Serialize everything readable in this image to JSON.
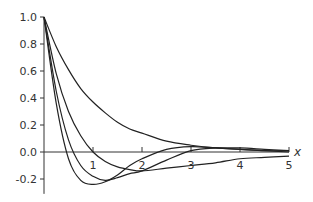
{
  "chart_data": {
    "type": "line",
    "title": "",
    "xlabel": "x",
    "ylabel": "",
    "xlim": [
      0,
      5
    ],
    "ylim": [
      -0.3,
      1.0
    ],
    "grid": false,
    "legend": null,
    "x_ticks": [
      "1",
      "2",
      "3",
      "4",
      "5"
    ],
    "y_ticks": [
      "1.0",
      "0.8",
      "0.6",
      "0.4",
      "0.2",
      "0.0",
      "-0.2"
    ],
    "x": [
      0,
      0.25,
      0.5,
      0.75,
      1,
      1.25,
      1.5,
      1.75,
      2,
      2.5,
      3,
      3.5,
      4,
      4.5,
      5
    ],
    "series": [
      {
        "name": "curve-1",
        "values": [
          1.0,
          0.78,
          0.61,
          0.47,
          0.37,
          0.29,
          0.22,
          0.17,
          0.14,
          0.08,
          0.05,
          0.03,
          0.02,
          0.01,
          0.01
        ]
      },
      {
        "name": "curve-2",
        "values": [
          1.0,
          0.58,
          0.3,
          0.12,
          0.0,
          -0.07,
          -0.11,
          -0.13,
          -0.14,
          -0.12,
          -0.1,
          -0.08,
          -0.05,
          -0.04,
          -0.03
        ]
      },
      {
        "name": "curve-3",
        "values": [
          1.0,
          0.45,
          0.09,
          -0.1,
          -0.18,
          -0.21,
          -0.19,
          -0.16,
          -0.14,
          -0.06,
          0.01,
          0.03,
          0.03,
          0.02,
          0.01
        ]
      },
      {
        "name": "curve-4",
        "values": [
          1.0,
          0.36,
          -0.05,
          -0.21,
          -0.24,
          -0.22,
          -0.17,
          -0.1,
          -0.05,
          0.02,
          0.04,
          0.03,
          0.02,
          0.01,
          0.0
        ]
      }
    ]
  },
  "axes": {
    "x_name": "x"
  }
}
